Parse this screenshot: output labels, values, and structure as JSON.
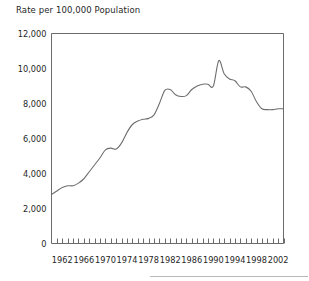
{
  "chart_data": {
    "type": "line",
    "title": "Rate per 100,000 Population",
    "xlabel": "",
    "ylabel": "",
    "grid": false,
    "legend": "none",
    "xlim": [
      1960,
      2003
    ],
    "ylim": [
      0,
      12000
    ],
    "ytick_labels": [
      "0",
      "2,000",
      "4,000",
      "6,000",
      "8,000",
      "10,000",
      "12,000"
    ],
    "ytick_values": [
      0,
      2000,
      4000,
      6000,
      8000,
      10000,
      12000
    ],
    "xtick_labels": [
      "1962",
      "1966",
      "1970",
      "1974",
      "1978",
      "1982",
      "1986",
      "1990",
      "1994",
      "1998",
      "2002"
    ],
    "xtick_values": [
      1962,
      1966,
      1970,
      1974,
      1978,
      1982,
      1986,
      1990,
      1994,
      1998,
      2002
    ],
    "line_color": "#6e6e6e",
    "x": [
      1960,
      1961,
      1962,
      1963,
      1964,
      1965,
      1966,
      1967,
      1968,
      1969,
      1970,
      1971,
      1972,
      1973,
      1974,
      1975,
      1976,
      1977,
      1978,
      1979,
      1980,
      1981,
      1982,
      1983,
      1984,
      1985,
      1986,
      1987,
      1988,
      1989,
      1990,
      1991,
      1992,
      1993,
      1994,
      1995,
      1996,
      1997,
      1998,
      1999,
      2000,
      2001,
      2002,
      2003
    ],
    "values": [
      2800,
      3000,
      3200,
      3300,
      3300,
      3450,
      3700,
      4100,
      4500,
      4900,
      5350,
      5450,
      5400,
      5750,
      6350,
      6800,
      7000,
      7100,
      7150,
      7350,
      8000,
      8750,
      8800,
      8500,
      8400,
      8450,
      8800,
      9000,
      9100,
      9100,
      9000,
      10450,
      9700,
      9400,
      9300,
      8950,
      8950,
      8700,
      8100,
      7700,
      7650,
      7650,
      7700,
      7700
    ],
    "annotations": []
  },
  "title": "Rate per 100,000 Population"
}
